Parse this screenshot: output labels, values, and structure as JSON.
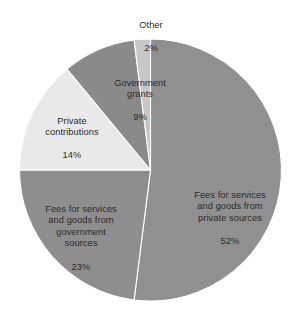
{
  "chart_data": {
    "type": "pie",
    "title": "",
    "subtitle": "",
    "xlabel": "",
    "ylabel": "",
    "legend_position": "none",
    "grid": false,
    "start_angle_deg": 0,
    "direction": "clockwise",
    "categories": [
      "Fees for services and goods from private sources",
      "Fees for services and goods from government sources",
      "Private contributions",
      "Government grants",
      "Other"
    ],
    "values": [
      52,
      23,
      14,
      9,
      2
    ],
    "value_unit": "%",
    "colors": [
      "#909090",
      "#8e8e8e",
      "#e9e9e9",
      "#8a8a8a",
      "#c7c7c7"
    ],
    "slices": [
      {
        "name": "private-sources",
        "label": "Fees for services\nand goods from\nprivate sources",
        "percent_label": "52%",
        "value": 52,
        "color": "#909090"
      },
      {
        "name": "government-sources",
        "label": "Fees for services\nand goods from\ngovernment\nsources",
        "percent_label": "23%",
        "value": 23,
        "color": "#8e8e8e"
      },
      {
        "name": "private-contributions",
        "label": "Private\ncontributions",
        "percent_label": "14%",
        "value": 14,
        "color": "#e9e9e9"
      },
      {
        "name": "government-grants",
        "label": "Government\ngrants",
        "percent_label": "9%",
        "value": 9,
        "color": "#8a8a8a"
      },
      {
        "name": "other",
        "label": "Other",
        "percent_label": "2%",
        "value": 2,
        "color": "#c7c7c7"
      }
    ]
  },
  "figure": {
    "background_color": "#ffffff",
    "text_color": "#2b2b2b",
    "separator_color": "#ffffff"
  }
}
